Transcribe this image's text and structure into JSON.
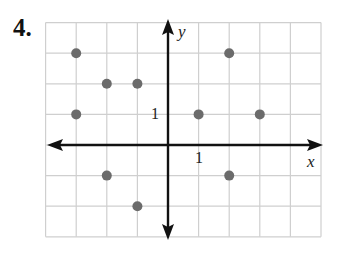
{
  "problem": {
    "number": "4."
  },
  "chart_data": {
    "type": "scatter",
    "title": "",
    "xlabel": "x",
    "ylabel": "y",
    "xlim": [
      -4,
      5
    ],
    "ylim": [
      -3,
      4
    ],
    "grid": true,
    "tick_labels": {
      "x": "1",
      "y": "1"
    },
    "points": [
      {
        "x": -3,
        "y": 3
      },
      {
        "x": -2,
        "y": 2
      },
      {
        "x": -1,
        "y": 2
      },
      {
        "x": -3,
        "y": 1
      },
      {
        "x": 2,
        "y": 3
      },
      {
        "x": 1,
        "y": 1
      },
      {
        "x": 3,
        "y": 1
      },
      {
        "x": -2,
        "y": -1
      },
      {
        "x": -1,
        "y": -2
      },
      {
        "x": 2,
        "y": -1
      }
    ],
    "point_color": "#6b6b6b",
    "grid_color": "#cfcfcf",
    "axis_color": "#111111"
  }
}
